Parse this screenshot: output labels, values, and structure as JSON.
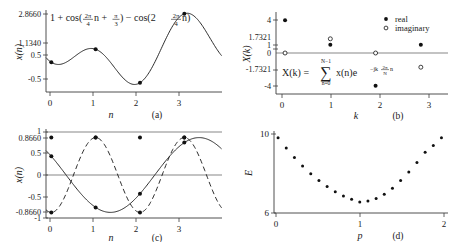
{
  "figure": {
    "background": "#ffffff",
    "ink": "#1a1a1a"
  },
  "panels": {
    "a": {
      "tag": "(a)",
      "xlabel": "n",
      "ylabel": "x(n)",
      "formula": "1 + cos(2π/4 n + π/3) − cos(2·2π/4 n)",
      "formula_parts": {
        "lead": "1 + cos(",
        "frac1_num": "2π",
        "frac1_den": "4",
        "mid1": "n + ",
        "frac2_num": "π",
        "frac2_den": "3",
        "mid2": ") − cos(2",
        "frac3_num": "2π",
        "frac3_den": "4",
        "tail": "n)"
      },
      "ytick_labels": [
        "2.8660",
        "1.1340",
        "0.5",
        "-0.5"
      ],
      "ytick_values": [
        2.866,
        1.134,
        0.5,
        -0.5
      ],
      "xtick_labels": [
        "0",
        "1",
        "2",
        "3"
      ],
      "xtick_values": [
        0,
        1,
        2,
        3
      ]
    },
    "b": {
      "tag": "(b)",
      "xlabel": "k",
      "ylabel": "X(k)",
      "formula": "X(k) = Σ(n=0..N−1) x(n) e^(−jk(2π/N)n)",
      "formula_parts": {
        "lhs": "X(k) =",
        "sum_upper": "N−1",
        "sum_symbol": "∑",
        "sum_lower": "n=0",
        "term": "x(n)e",
        "exp_lead": "−jk",
        "exp_num": "2π",
        "exp_den": "N",
        "exp_tail": "n"
      },
      "ytick_labels": [
        "4",
        "1.7321",
        "1",
        "0",
        "-1.7321",
        "-4"
      ],
      "ytick_values": [
        4,
        1.7321,
        1,
        0,
        -1.7321,
        -4
      ],
      "xtick_labels": [
        "0",
        "1",
        "2",
        "3"
      ],
      "xtick_values": [
        0,
        1,
        2,
        3
      ],
      "legend": [
        {
          "marker": "filled-dot",
          "label": "real"
        },
        {
          "marker": "open-circle",
          "label": "imaginary"
        }
      ]
    },
    "c": {
      "tag": "(c)",
      "xlabel": "n",
      "ylabel": "x(n)",
      "ytick_labels": [
        "1",
        "0.8660",
        "0.5",
        "0",
        "-0.5",
        "-0.8660",
        "-1"
      ],
      "ytick_values": [
        1,
        0.866,
        0.5,
        0,
        -0.5,
        -0.866,
        -1
      ],
      "xtick_labels": [
        "0",
        "1",
        "2",
        "3"
      ],
      "xtick_values": [
        0,
        1,
        2,
        3
      ]
    },
    "d": {
      "tag": "(d)",
      "xlabel": "p",
      "ylabel": "E",
      "ytick_labels": [
        "10",
        "6"
      ],
      "ytick_values": [
        10,
        6
      ],
      "xtick_labels": [
        "0",
        "1",
        "2"
      ],
      "xtick_values": [
        0,
        1,
        2
      ]
    }
  },
  "chart_data": [
    {
      "id": "panel-a",
      "type": "line",
      "title": "1 + cos(2π/4 n + π/3) − cos(2·2π/4 n)",
      "xlabel": "n",
      "ylabel": "x(n)",
      "xlim": [
        -0.12,
        3.85
      ],
      "ylim": [
        -0.95,
        3.05
      ],
      "grid": false,
      "yticks": [
        2.866,
        1.134,
        0.5,
        -0.5
      ],
      "xticks": [
        0,
        1,
        2,
        3
      ],
      "samples": {
        "x": [
          0,
          1,
          2,
          3
        ],
        "y": [
          0.5,
          1.134,
          -0.5,
          2.866
        ]
      },
      "continuous_note": "smooth interpolation of 1+cos(pi/2 t + pi/3) - cos(pi t)"
    },
    {
      "id": "panel-b",
      "type": "scatter",
      "title": "DFT X(k)",
      "xlabel": "k",
      "ylabel": "X(k)",
      "xlim": [
        -0.2,
        3.6
      ],
      "ylim": [
        -5.0,
        5.0
      ],
      "grid": false,
      "yticks": [
        4,
        1.7321,
        1,
        0,
        -1.7321,
        -4
      ],
      "xticks": [
        0,
        1,
        2,
        3
      ],
      "series": [
        {
          "name": "real",
          "marker": "filled-dot",
          "x": [
            0,
            1,
            2,
            3
          ],
          "values": [
            4,
            1,
            -4,
            1
          ]
        },
        {
          "name": "imaginary",
          "marker": "open-circle",
          "x": [
            0,
            1,
            2,
            3
          ],
          "values": [
            0,
            1.7321,
            0,
            -1.7321
          ]
        }
      ]
    },
    {
      "id": "panel-c",
      "type": "line",
      "title": "Basis components",
      "xlabel": "n",
      "ylabel": "x(n)",
      "xlim": [
        -0.12,
        3.85
      ],
      "ylim": [
        -1.15,
        1.15
      ],
      "grid": true,
      "gridlines_y": [
        1,
        -1,
        0
      ],
      "yticks": [
        1,
        0.866,
        0.5,
        0,
        -0.5,
        -0.866,
        -1
      ],
      "xticks": [
        0,
        1,
        2,
        3
      ],
      "series": [
        {
          "name": "constant",
          "style": "solid-horizontal",
          "x": [
            0,
            1,
            2,
            3
          ],
          "values": [
            1,
            1,
            1,
            1
          ]
        },
        {
          "name": "cosine",
          "style": "solid",
          "x": [
            0,
            1,
            2,
            3
          ],
          "values": [
            0.5,
            -0.866,
            -0.5,
            0.866
          ]
        },
        {
          "name": "second-harmonic",
          "style": "dashed",
          "x": [
            0,
            1,
            2,
            3
          ],
          "values": [
            -1,
            1,
            -1,
            1
          ]
        }
      ]
    },
    {
      "id": "panel-d",
      "type": "scatter",
      "title": "Error E versus p",
      "xlabel": "p",
      "ylabel": "E",
      "xlim": [
        -0.05,
        2.08
      ],
      "ylim": [
        5.6,
        10.4
      ],
      "grid": false,
      "yticks": [
        10,
        6
      ],
      "xticks": [
        0,
        1,
        2
      ],
      "x": [
        0,
        0.1,
        0.2,
        0.3,
        0.4,
        0.5,
        0.6,
        0.7,
        0.8,
        0.9,
        1.0,
        1.1,
        1.2,
        1.3,
        1.4,
        1.5,
        1.6,
        1.7,
        1.8,
        1.9,
        2.0
      ],
      "values": [
        10.0,
        9.4,
        8.85,
        8.35,
        7.9,
        7.5,
        7.15,
        6.85,
        6.6,
        6.4,
        6.25,
        6.3,
        6.45,
        6.7,
        7.05,
        7.5,
        8.0,
        8.55,
        9.15,
        9.55,
        10.0
      ]
    }
  ]
}
